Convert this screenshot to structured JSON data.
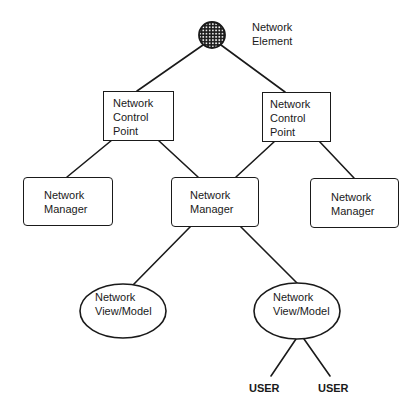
{
  "diagram": {
    "type": "hierarchy",
    "colors": {
      "stroke": "#1a1a1a",
      "background": "#ffffff"
    },
    "nodes": {
      "network_element": {
        "shape": "hatched-circle",
        "line1": "Network",
        "line2": "Element"
      },
      "ncp_left": {
        "shape": "rectangle",
        "line1": "Network",
        "line2": "Control",
        "line3": "Point"
      },
      "ncp_right": {
        "shape": "rectangle",
        "line1": "Network",
        "line2": "Control",
        "line3": "Point"
      },
      "nm_left": {
        "shape": "rounded-rectangle",
        "line1": "Network",
        "line2": "Manager"
      },
      "nm_middle": {
        "shape": "rounded-rectangle",
        "line1": "Network",
        "line2": "Manager"
      },
      "nm_right": {
        "shape": "rounded-rectangle",
        "line1": "Network",
        "line2": "Manager"
      },
      "view_left": {
        "shape": "ellipse",
        "line1": "Network",
        "line2": "View/Model"
      },
      "view_right": {
        "shape": "ellipse",
        "line1": "Network",
        "line2": "View/Model"
      },
      "user_left": {
        "shape": "text",
        "label": "USER"
      },
      "user_right": {
        "shape": "text",
        "label": "USER"
      }
    },
    "edges": [
      [
        "network_element",
        "ncp_left"
      ],
      [
        "network_element",
        "ncp_right"
      ],
      [
        "ncp_left",
        "nm_left"
      ],
      [
        "ncp_left",
        "nm_middle"
      ],
      [
        "ncp_right",
        "nm_middle"
      ],
      [
        "ncp_right",
        "nm_right"
      ],
      [
        "nm_middle",
        "view_left"
      ],
      [
        "nm_middle",
        "view_right"
      ],
      [
        "view_right",
        "user_left"
      ],
      [
        "view_right",
        "user_right"
      ]
    ]
  }
}
